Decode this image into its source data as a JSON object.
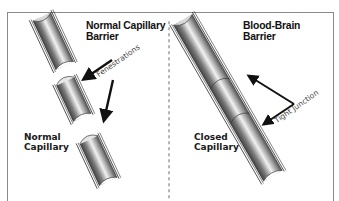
{
  "left_panel": {
    "title_line1": "Normal Capillary",
    "title_line2": "Barrier",
    "label_line1": "Normal",
    "label_line2": "Capillary",
    "annotation": "Fenestrations"
  },
  "right_panel": {
    "title_line1": "Blood-Brain",
    "title_line2": "Barrier",
    "label_line1": "Closed",
    "label_line2": "Capillary",
    "annotation": "Tight Junction"
  },
  "colors": {
    "frame": "#8a8a8a",
    "divider": "#b5b5b5",
    "arrow": "#111111",
    "tube_dark": "#5a5a5a",
    "tube_light": "#f4f4f4"
  }
}
